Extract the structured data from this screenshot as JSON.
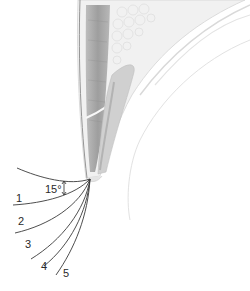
{
  "diagram": {
    "angle_label": "15°",
    "curl_labels": [
      "1",
      "2",
      "3",
      "4",
      "5"
    ],
    "colors": {
      "background": "#ffffff",
      "lash_line": "#3a3a3a",
      "tissue_dark": "#a8a8a8",
      "tissue_mid": "#cfcfcf",
      "tissue_light": "#e6e6e6",
      "label_text": "#2a2a2a"
    }
  }
}
